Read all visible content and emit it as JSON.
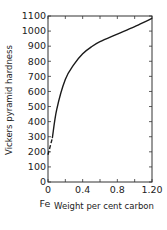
{
  "chart_data": {
    "type": "line",
    "title": "",
    "xlabel": "Weight per cent carbon",
    "ylabel": "Vickers pyramid hardness",
    "x_origin_label": "Fe",
    "xlim": [
      0,
      1.2
    ],
    "ylim": [
      0,
      1100
    ],
    "grid": false,
    "legend": null,
    "x_ticks": [
      0,
      0.2,
      0.4,
      0.6,
      0.8,
      1.0,
      1.2
    ],
    "x_tick_labels": [
      "0",
      "",
      "0.4",
      "",
      "0.8",
      "",
      "1.20"
    ],
    "y_ticks": [
      0,
      100,
      200,
      300,
      400,
      500,
      600,
      700,
      800,
      900,
      1000,
      1100
    ],
    "y_tick_labels": [
      "0",
      "100",
      "200",
      "300",
      "400",
      "500",
      "600",
      "700",
      "800",
      "900",
      "1000",
      "1100"
    ],
    "series": [
      {
        "name": "hardness (extrapolated, dashed)",
        "style": "dashed",
        "x": [
          0.0,
          0.05
        ],
        "y": [
          180,
          290
        ]
      },
      {
        "name": "hardness",
        "style": "solid",
        "x": [
          0.05,
          0.1,
          0.2,
          0.3,
          0.4,
          0.5,
          0.6,
          0.8,
          1.0,
          1.2
        ],
        "y": [
          290,
          480,
          680,
          780,
          850,
          895,
          930,
          980,
          1030,
          1085
        ]
      }
    ]
  },
  "colors": {
    "line": "#1a1a1a",
    "axis": "#333333",
    "background": "#ffffff"
  }
}
